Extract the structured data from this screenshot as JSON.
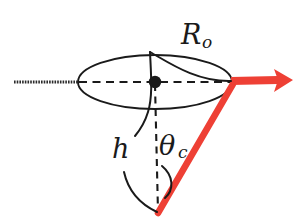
{
  "figure": {
    "background_color": "#ffffff",
    "ink_color": "#1a1a1a",
    "accent_color": "#ee4035",
    "width": 305,
    "height": 224
  },
  "labels": {
    "radius": {
      "symbol": "R",
      "subscript": "o",
      "full": "Ro",
      "x": 183,
      "y": 42
    },
    "height": {
      "symbol": "h",
      "subscript": "",
      "full": "h",
      "x": 114,
      "y": 158
    },
    "cone_angle": {
      "symbol": "θ",
      "subscript": "c",
      "full": "θc",
      "x": 161,
      "y": 155
    }
  },
  "geometry": {
    "ellipse": {
      "center_x": 155,
      "center_y": 82,
      "radius_x": 77,
      "radius_y": 27
    },
    "apex": {
      "x": 158,
      "y": 213
    },
    "center_dot": {
      "x": 155,
      "y": 82,
      "radius": 6
    },
    "axis_line": {
      "x1": 14,
      "y1": 82,
      "x2": 78,
      "y2": 82
    },
    "dashed_major_axis": {
      "x1": 78,
      "y1": 82,
      "x2": 232,
      "y2": 82
    },
    "dashed_height_line": {
      "x1": 155,
      "y1": 82,
      "x2": 158,
      "y2": 213
    },
    "arrow": {
      "x1": 232,
      "y1": 82,
      "x2": 292,
      "y2": 80,
      "head_width": 18,
      "head_length": 20
    },
    "slant_line": {
      "x1": 232,
      "y1": 83,
      "x2": 158,
      "y2": 213
    }
  },
  "leaders": {
    "radius_arc": "M 152 52 Q 186 88 232 82",
    "radius_arc_alt": "M 148 48 C 150 80 146 110 136 128",
    "height_arc": "M 124 176 Q 132 200 157 212",
    "angle_arc": "M 163 168 Q 175 182 168 196"
  }
}
